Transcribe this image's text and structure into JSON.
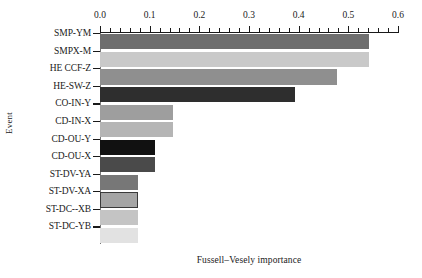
{
  "chart_data": {
    "type": "bar",
    "orientation": "horizontal",
    "title": "",
    "xlabel": "Fussell–Vesely importance",
    "ylabel": "Event",
    "xlim": [
      0.0,
      0.6
    ],
    "grid": false,
    "legend": "none",
    "xticks": [
      "0.0",
      "0.1",
      "0.2",
      "0.3",
      "0.4",
      "0.5",
      "0.6"
    ],
    "xtick_values": [
      0.0,
      0.1,
      0.2,
      0.3,
      0.4,
      0.5,
      0.6
    ],
    "minor_tick_count_per_interval": 4,
    "axis_position": "top",
    "categories": [
      "SMP-YM",
      "SMPX-M",
      "HE CCF-Z",
      "HE-SW-Z",
      "CO-IN-Y",
      "CD-IN-X",
      "CD-OU-Y",
      "CD-OU-X",
      "ST-DV-YA",
      "ST-DV-XA",
      "ST-DC--XB",
      "ST-DC-YB"
    ],
    "values": [
      0.542,
      0.542,
      0.477,
      0.392,
      0.147,
      0.147,
      0.111,
      0.111,
      0.076,
      0.076,
      0.076,
      0.076
    ],
    "bar_colors": [
      "#6e6e6e",
      "#c9c9c9",
      "#8f8f8f",
      "#2e2e2e",
      "#9e9e9e",
      "#b5b5b5",
      "#111111",
      "#4a4a4a",
      "#777777",
      "#a5a5a5",
      "#c4c4c4",
      "#e2e2e2"
    ],
    "bar_outlined": [
      false,
      false,
      false,
      false,
      false,
      false,
      false,
      false,
      false,
      true,
      false,
      false
    ]
  }
}
